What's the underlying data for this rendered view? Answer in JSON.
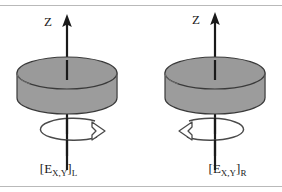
{
  "figure": {
    "width": 282,
    "height": 192,
    "background": "#ffffff",
    "rule_color": "#b9b9b9",
    "ink_color": "#1a1a1a",
    "cylinder_top_fill": "#9a9a9a",
    "cylinder_side_fill": "#9c9c9c",
    "cylinder_stroke": "#3a3a3a",
    "arrow_fill": "#ffffff",
    "arrow_stroke": "#4a4a4a"
  },
  "panels": [
    {
      "id": "left",
      "side": "L",
      "axis_label": "Z",
      "axis_direction": "up",
      "rotation_direction": "arrowhead-right",
      "label_bracket_open": "[",
      "label_symbol": "E",
      "label_sub_xy": "X,Y",
      "label_bracket_close": "]",
      "label_sub_side": "L",
      "label_full": "[E X,Y ] L"
    },
    {
      "id": "right",
      "side": "R",
      "axis_label": "Z",
      "axis_direction": "up",
      "rotation_direction": "arrowhead-left",
      "label_bracket_open": "[",
      "label_symbol": "E",
      "label_sub_xy": "X,Y",
      "label_bracket_close": "]",
      "label_sub_side": "R",
      "label_full": "[E X,Y ] R"
    }
  ]
}
